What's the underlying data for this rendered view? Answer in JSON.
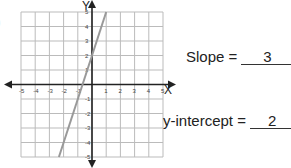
{
  "chart_data": {
    "type": "line",
    "title": "",
    "xlabel": "X",
    "ylabel": "Y",
    "xlim": [
      -5,
      5
    ],
    "ylim": [
      -5,
      5
    ],
    "grid": true,
    "x_ticks": [
      -5,
      -4,
      -3,
      -2,
      -1,
      1,
      2,
      3,
      4,
      5
    ],
    "y_ticks": [
      -5,
      -4,
      -3,
      -2,
      -1,
      1,
      2,
      3,
      4,
      5
    ],
    "series": [
      {
        "name": "line",
        "equation": "y = 3x + 2",
        "x": [
          -2.33,
          1
        ],
        "y": [
          -5,
          5
        ],
        "color": "#999999"
      }
    ]
  },
  "answers": {
    "slope_label": "Slope =",
    "slope_value": "3",
    "intercept_label": "y-intercept =",
    "intercept_value": "2"
  },
  "partial_text": ")"
}
